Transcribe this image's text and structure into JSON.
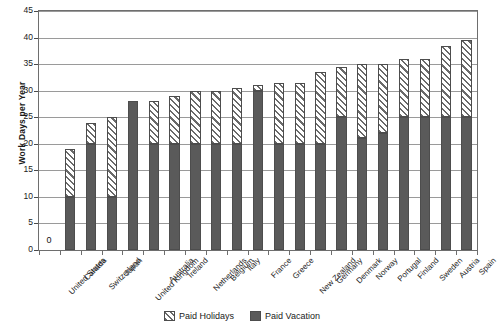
{
  "chart_data": {
    "type": "bar",
    "stacked": true,
    "title": "",
    "xlabel": "",
    "ylabel": "Work Days per Year",
    "ylim": [
      0,
      45
    ],
    "ytick_step": 5,
    "yticks": [
      "0",
      "5",
      "10",
      "15",
      "20",
      "25",
      "30",
      "35",
      "40",
      "45"
    ],
    "grid": true,
    "legend_position": "bottom-center",
    "categories": [
      "United States",
      "Canada",
      "Switzerland",
      "Japan",
      "United Kingdom",
      "Australia",
      "Ireland",
      "Netherlands",
      "Belgium",
      "Italy",
      "France",
      "Greece",
      "New Zealand",
      "Germany",
      "Denmark",
      "Norway",
      "Portugal",
      "Finland",
      "Sweden",
      "Austria",
      "Spain"
    ],
    "series": [
      {
        "name": "Paid Vacation",
        "color": "#5a5a5a",
        "values": [
          0,
          10,
          20,
          10,
          28,
          20,
          20,
          20,
          20,
          20,
          30,
          20,
          20,
          20,
          25,
          21,
          22,
          25,
          25,
          25,
          25
        ]
      },
      {
        "name": "Paid Holidays",
        "color": "#6a6a6a",
        "pattern": "diagonal-hatch",
        "values": [
          0,
          9,
          4,
          15,
          0,
          8,
          9,
          10,
          10,
          10.5,
          1,
          11.5,
          11.5,
          13.5,
          9.5,
          14,
          13,
          11,
          11,
          13.5,
          14.5
        ]
      }
    ],
    "totals": [
      0,
      19,
      24,
      25,
      28,
      28,
      29,
      30,
      30,
      30.5,
      31,
      31.5,
      31.5,
      33.5,
      34.5,
      35,
      35,
      36,
      36,
      38.5,
      39.5
    ],
    "annotations": [
      {
        "category": "United States",
        "text": "0",
        "position": "above-baseline"
      }
    ],
    "legend": [
      {
        "label": "Paid Holidays",
        "swatch": "hatched"
      },
      {
        "label": "Paid Vacation",
        "swatch": "solid-gray"
      }
    ]
  }
}
